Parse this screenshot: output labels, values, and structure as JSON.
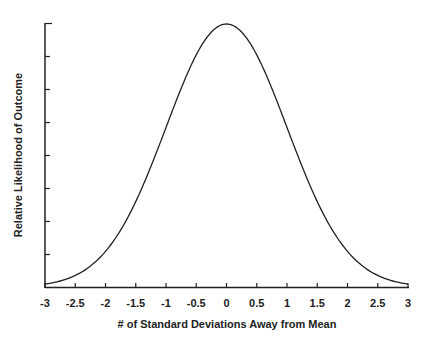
{
  "chart_data": {
    "type": "line",
    "title": "",
    "xlabel": "# of Standard Deviations Away from Mean",
    "ylabel": "Relative Likelihood of Outcome",
    "xlim": [
      -3,
      3
    ],
    "ylim": [
      0,
      0.4
    ],
    "x_ticks": [
      "-3",
      "-2.5",
      "-2",
      "-1.5",
      "-1",
      "-0.5",
      "0",
      "0.5",
      "1",
      "1.5",
      "2",
      "2.5",
      "3"
    ],
    "y_ticks_count": 8,
    "y_tick_labels": [],
    "grid": false,
    "legend": null,
    "series": [
      {
        "name": "Standard normal distribution",
        "x": [
          -3,
          -2.5,
          -2,
          -1.5,
          -1,
          -0.5,
          0,
          0.5,
          1,
          1.5,
          2,
          2.5,
          3
        ],
        "values": [
          0.0044,
          0.0175,
          0.054,
          0.1295,
          0.242,
          0.352,
          0.399,
          0.352,
          0.242,
          0.1295,
          0.054,
          0.0175,
          0.0044
        ]
      }
    ]
  }
}
